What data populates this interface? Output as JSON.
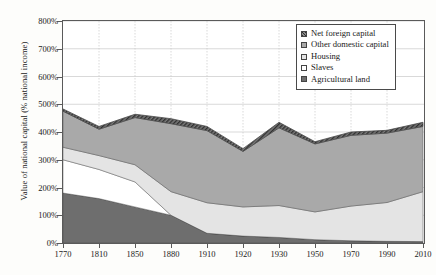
{
  "chart_data": {
    "type": "area",
    "stacked": true,
    "title": "",
    "xlabel": "",
    "ylabel": "Value of national capital (% national income)",
    "categories": [
      "1770",
      "1810",
      "1850",
      "1880",
      "1910",
      "1920",
      "1930",
      "1950",
      "1970",
      "1990",
      "2010"
    ],
    "ytick_labels": [
      "0%",
      "100%",
      "200%",
      "300%",
      "400%",
      "500%",
      "600%",
      "700%",
      "800%"
    ],
    "ytick_values": [
      0,
      100,
      200,
      300,
      400,
      500,
      600,
      700,
      800
    ],
    "ylim": [
      0,
      800
    ],
    "grid": true,
    "grid_axis": "both",
    "legend_position": "top-right",
    "series": [
      {
        "name": "Agricultural land",
        "color": "#6e6e6e",
        "values": [
          180,
          160,
          130,
          100,
          35,
          25,
          20,
          12,
          8,
          6,
          5
        ]
      },
      {
        "name": "Slaves",
        "color": "#ffffff",
        "values": [
          120,
          105,
          90,
          0,
          0,
          0,
          0,
          0,
          0,
          0,
          0
        ]
      },
      {
        "name": "Housing",
        "color": "#e4e4e4",
        "values": [
          45,
          50,
          62,
          85,
          110,
          105,
          115,
          100,
          125,
          140,
          180
        ]
      },
      {
        "name": "Other domestic capital",
        "color": "#a9a9a9",
        "values": [
          130,
          95,
          170,
          245,
          260,
          200,
          280,
          245,
          255,
          250,
          235
        ]
      },
      {
        "name": "Net foreign capital",
        "color": "#4a4a4a",
        "values": [
          8,
          10,
          12,
          18,
          15,
          10,
          20,
          8,
          12,
          10,
          15
        ]
      }
    ],
    "totals": [
      483,
      420,
      464,
      448,
      420,
      340,
      435,
      365,
      400,
      406,
      435
    ]
  },
  "legend": {
    "items": [
      {
        "label": "Net foreign capital",
        "swatch": "hatched-dark"
      },
      {
        "label": "Other domestic capital",
        "swatch": "medium-gray"
      },
      {
        "label": "Housing",
        "swatch": "light-gray"
      },
      {
        "label": "Slaves",
        "swatch": "white"
      },
      {
        "label": "Agricultural land",
        "swatch": "dark-gray"
      }
    ]
  },
  "colors": {
    "agricultural_land": "#6e6e6e",
    "slaves": "#ffffff",
    "housing": "#e4e4e4",
    "other_domestic_capital": "#a9a9a9",
    "net_foreign_capital": "#4a4a4a",
    "axis": "#5a5a5a",
    "grid": "#c8c8c8",
    "background": "#fdfdfb"
  }
}
